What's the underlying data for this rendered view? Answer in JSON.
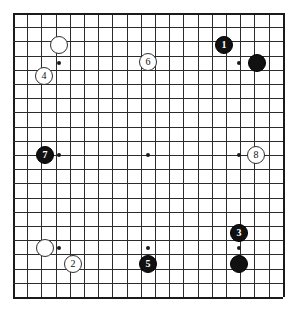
{
  "board": {
    "type": "go-board",
    "columns": 19,
    "rows": 20,
    "line_color": "#2b2b2b",
    "edge_color": "#1a1a1a",
    "background_color": "#ffffff",
    "star_point_color": "#1a1a1a",
    "star_points_px": [
      {
        "x": 59,
        "y": 63
      },
      {
        "x": 148,
        "y": 63
      },
      {
        "x": 239,
        "y": 63
      },
      {
        "x": 59,
        "y": 155
      },
      {
        "x": 148,
        "y": 155
      },
      {
        "x": 239,
        "y": 155
      },
      {
        "x": 59,
        "y": 248
      },
      {
        "x": 148,
        "y": 248
      },
      {
        "x": 239,
        "y": 248
      }
    ]
  },
  "stones": [
    {
      "id": "stone-white-a",
      "color": "white",
      "label": "",
      "x": 59,
      "y": 45,
      "r": 9
    },
    {
      "id": "stone-move-4",
      "color": "white",
      "label": "4",
      "x": 44,
      "y": 76,
      "r": 9
    },
    {
      "id": "stone-move-6",
      "color": "white",
      "label": "6",
      "x": 148,
      "y": 62,
      "r": 9
    },
    {
      "id": "stone-move-1",
      "color": "black",
      "label": "1",
      "x": 224,
      "y": 45,
      "r": 9
    },
    {
      "id": "stone-black-b",
      "color": "black",
      "label": "",
      "x": 257,
      "y": 63,
      "r": 9
    },
    {
      "id": "stone-move-7",
      "color": "black",
      "label": "7",
      "x": 45,
      "y": 155,
      "r": 9
    },
    {
      "id": "stone-move-8",
      "color": "white",
      "label": "8",
      "x": 256,
      "y": 155,
      "r": 9
    },
    {
      "id": "stone-move-3",
      "color": "black",
      "label": "3",
      "x": 239,
      "y": 233,
      "r": 9
    },
    {
      "id": "stone-black-c",
      "color": "black",
      "label": "",
      "x": 239,
      "y": 264,
      "r": 9
    },
    {
      "id": "stone-white-d",
      "color": "white",
      "label": "",
      "x": 45,
      "y": 248,
      "r": 9
    },
    {
      "id": "stone-move-2",
      "color": "white",
      "label": "2",
      "x": 73,
      "y": 264,
      "r": 9
    },
    {
      "id": "stone-move-5",
      "color": "black",
      "label": "5",
      "x": 148,
      "y": 264,
      "r": 9
    }
  ],
  "move_numbers": [
    "1",
    "2",
    "3",
    "4",
    "5",
    "6",
    "7",
    "8"
  ],
  "colors": {
    "black_stone": "#111111",
    "white_stone": "#ffffff",
    "grid": "#2b2b2b",
    "board_background": "#ffffff"
  }
}
